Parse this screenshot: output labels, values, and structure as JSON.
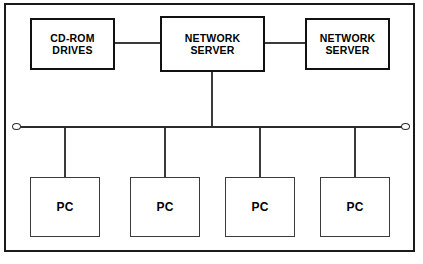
{
  "diagram": {
    "frame": {
      "present": true,
      "border_color": "#1a1a1a"
    },
    "colors": {
      "line": "#3a3a3a",
      "bus": "#2b2b2b",
      "box_border_heavy": "#111111",
      "box_border_light": "#3b3b3b",
      "text": "#000000",
      "background": "#ffffff"
    },
    "top_row": [
      {
        "id": "cd-rom-drives",
        "label": "CD-ROM\nDRIVES",
        "x": 30,
        "y": 18,
        "w": 85,
        "h": 52
      },
      {
        "id": "network-server-center",
        "label": "NETWORK\nSERVER",
        "x": 160,
        "y": 16,
        "w": 105,
        "h": 56
      },
      {
        "id": "network-server-right",
        "label": "NETWORK\nSERVER",
        "x": 305,
        "y": 18,
        "w": 85,
        "h": 52
      }
    ],
    "workstations": [
      {
        "id": "pc-1",
        "label": "PC",
        "x": 30,
        "y": 177,
        "w": 70,
        "h": 60,
        "drop_x": 65
      },
      {
        "id": "pc-2",
        "label": "PC",
        "x": 130,
        "y": 177,
        "w": 70,
        "h": 60,
        "drop_x": 165
      },
      {
        "id": "pc-3",
        "label": "PC",
        "x": 225,
        "y": 177,
        "w": 70,
        "h": 60,
        "drop_x": 260
      },
      {
        "id": "pc-4",
        "label": "PC",
        "x": 320,
        "y": 177,
        "w": 70,
        "h": 60,
        "drop_x": 355
      }
    ],
    "bus": {
      "y": 126,
      "x_start": 20,
      "x_end": 403,
      "left_terminator_x": 12,
      "right_terminator_x": 402,
      "server_drop_x": 211
    },
    "links": [
      {
        "id": "cdrom-to-center-server",
        "type": "horizontal",
        "x": 115,
        "y": 43,
        "length": 45
      },
      {
        "id": "center-server-to-right-server",
        "type": "horizontal",
        "x": 265,
        "y": 43,
        "length": 40
      },
      {
        "id": "center-server-to-bus",
        "type": "vertical",
        "x": 211,
        "y": 72,
        "length": 55
      }
    ]
  }
}
